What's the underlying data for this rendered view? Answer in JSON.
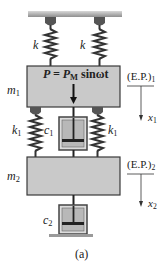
{
  "diagram": {
    "caption": "(a)",
    "ceiling": {
      "label": ""
    },
    "springs_top": [
      {
        "label": "k"
      },
      {
        "label": "k"
      }
    ],
    "mass1": {
      "label": "m",
      "sub": "1"
    },
    "force": {
      "lhs": "P = P",
      "sub": "M",
      "rhs": " sinωt"
    },
    "equilibrium1": {
      "label": "(E.P.)",
      "sub": "1",
      "coord": "x",
      "coord_sub": "1"
    },
    "springs_mid": [
      {
        "label": "k",
        "sub": "1"
      },
      {
        "label": "k",
        "sub": "1"
      }
    ],
    "damper1": {
      "label": "c",
      "sub": "1"
    },
    "mass2": {
      "label": "m",
      "sub": "2"
    },
    "equilibrium2": {
      "label": "(E.P.)",
      "sub": "2",
      "coord": "x",
      "coord_sub": "2"
    },
    "damper2": {
      "label": "c",
      "sub": "2"
    },
    "colors": {
      "block_fill": "#c9c9c9",
      "block_stroke": "#3a3a3a",
      "ceiling": "#b5b5b5",
      "ink": "#222222"
    }
  }
}
